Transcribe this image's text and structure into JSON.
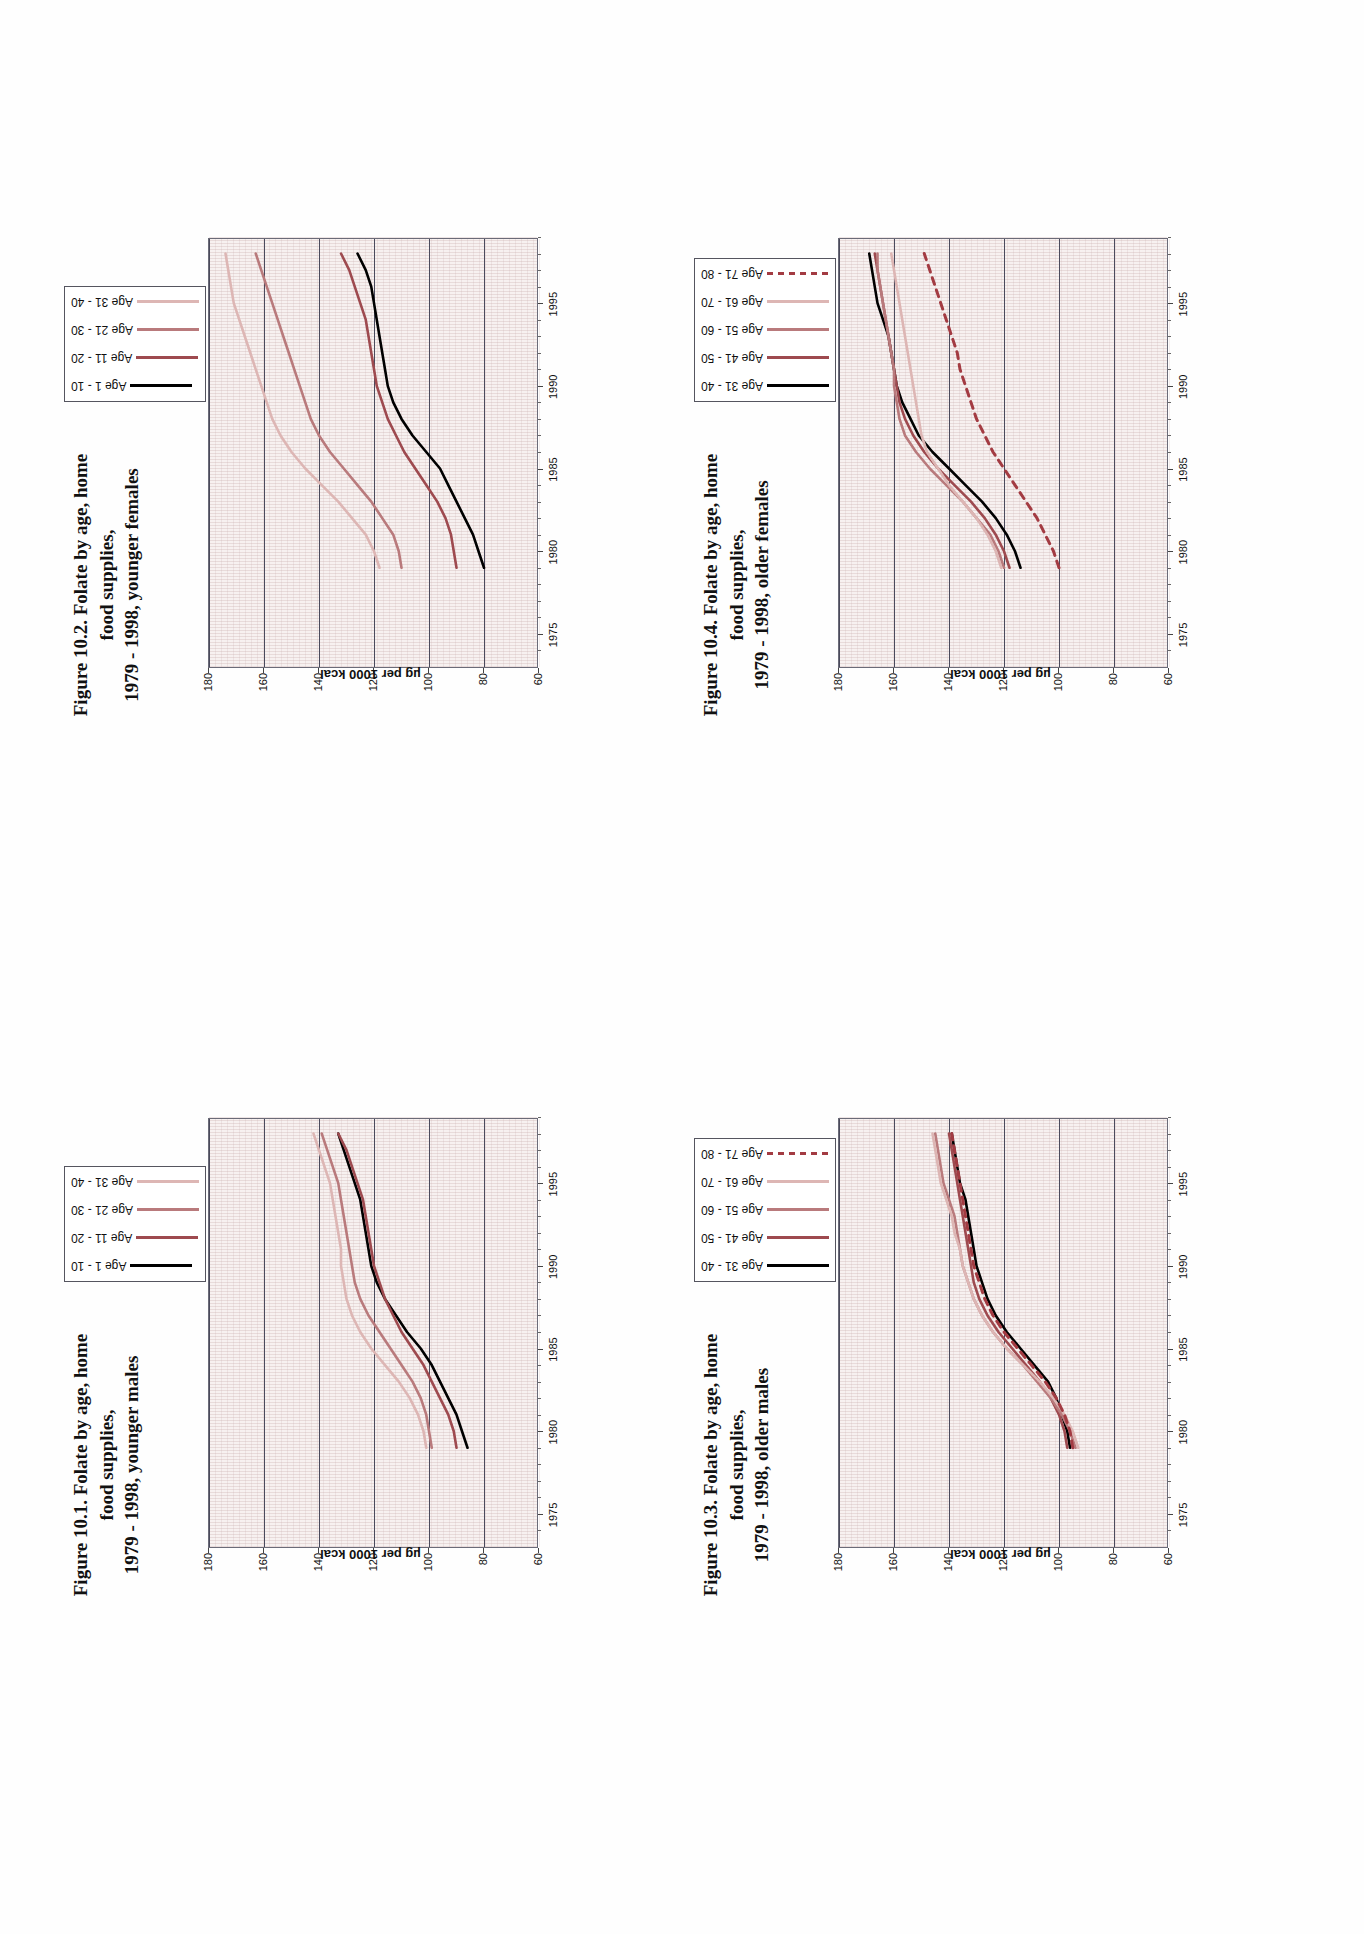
{
  "page": {
    "background": "#ffffff",
    "orientation": "landscape-rotated-90ccw"
  },
  "palette": {
    "series_1": "#000000",
    "series_2": "#9e4a4f",
    "series_3": "#b97a7c",
    "series_4": "#ddb6b4",
    "series_5": "#a33b42",
    "plot_bg": "#f7f1f0",
    "grid": "#4a4a5c",
    "axis": "#55555f"
  },
  "axis_common": {
    "ylabel": "µg per 1000 kcal",
    "yticks": [
      180,
      160,
      140,
      120,
      100,
      80,
      60
    ],
    "ylim": [
      60,
      180
    ],
    "xticks": [
      1975,
      1980,
      1985,
      1990,
      1995
    ],
    "xlim": [
      1973,
      1999
    ],
    "xlabel": ""
  },
  "figures": [
    {
      "id": "fig-10-1",
      "title": "Figure 10.1. Folate by age, home food supplies,\n1979 - 1998, younger males",
      "legend": [
        {
          "label": "Age 1 - 10",
          "color": "#000000",
          "dashed": false
        },
        {
          "label": "Age 11 - 20",
          "color": "#9e4a4f",
          "dashed": false
        },
        {
          "label": "Age 21 - 30",
          "color": "#b97a7c",
          "dashed": false
        },
        {
          "label": "Age 31 - 40",
          "color": "#ddb6b4",
          "dashed": false
        }
      ],
      "chart_data": {
        "type": "line",
        "title": "Figure 10.1. Folate by age, home food supplies, 1979 - 1998, younger males",
        "xlabel": "",
        "ylabel": "µg per 1000 kcal",
        "ylim": [
          60,
          180
        ],
        "xlim": [
          1973,
          1999
        ],
        "grid": true,
        "legend_position": "top-right",
        "x": [
          1979,
          1980,
          1981,
          1982,
          1983,
          1984,
          1985,
          1986,
          1987,
          1988,
          1989,
          1990,
          1991,
          1992,
          1993,
          1994,
          1995,
          1996,
          1997,
          1998
        ],
        "series": [
          {
            "name": "Age 1 - 10",
            "color": "#000000",
            "values": [
              86,
              88,
              90,
              93,
              96,
              99,
              103,
              108,
              112,
              116,
              119,
              121,
              122,
              123,
              124,
              125,
              127,
              129,
              131,
              133
            ]
          },
          {
            "name": "Age 11 - 20",
            "color": "#9e4a4f",
            "values": [
              90,
              91,
              93,
              96,
              99,
              102,
              106,
              110,
              113,
              116,
              118,
              120,
              121,
              122,
              123,
              124,
              126,
              128,
              130,
              133
            ]
          },
          {
            "name": "Age 21 - 30",
            "color": "#b97a7c",
            "values": [
              99,
              100,
              101,
              103,
              106,
              110,
              114,
              118,
              122,
              125,
              127,
              128,
              129,
              130,
              131,
              132,
              133,
              135,
              137,
              139
            ]
          },
          {
            "name": "Age 31 - 40",
            "color": "#ddb6b4",
            "values": [
              101,
              102,
              104,
              107,
              111,
              116,
              121,
              125,
              128,
              130,
              131,
              132,
              132,
              133,
              134,
              135,
              136,
              138,
              140,
              142
            ]
          }
        ]
      }
    },
    {
      "id": "fig-10-2",
      "title": "Figure 10.2. Folate by age, home food supplies,\n1979 - 1998, younger females",
      "legend": [
        {
          "label": "Age 1 - 10",
          "color": "#000000",
          "dashed": false
        },
        {
          "label": "Age 11 - 20",
          "color": "#9e4a4f",
          "dashed": false
        },
        {
          "label": "Age 21 - 30",
          "color": "#b97a7c",
          "dashed": false
        },
        {
          "label": "Age 31 - 40",
          "color": "#ddb6b4",
          "dashed": false
        }
      ],
      "chart_data": {
        "type": "line",
        "title": "Figure 10.2. Folate by age, home food supplies, 1979 - 1998, younger females",
        "xlabel": "",
        "ylabel": "µg per 1000 kcal",
        "ylim": [
          60,
          180
        ],
        "xlim": [
          1973,
          1999
        ],
        "grid": true,
        "legend_position": "top-right",
        "x": [
          1979,
          1980,
          1981,
          1982,
          1983,
          1984,
          1985,
          1986,
          1987,
          1988,
          1989,
          1990,
          1991,
          1992,
          1993,
          1994,
          1995,
          1996,
          1997,
          1998
        ],
        "series": [
          {
            "name": "Age 1 - 10",
            "color": "#000000",
            "values": [
              80,
              82,
              84,
              87,
              90,
              93,
              96,
              101,
              106,
              110,
              113,
              115,
              116,
              117,
              118,
              119,
              120,
              121,
              123,
              126
            ]
          },
          {
            "name": "Age 11 - 20",
            "color": "#9e4a4f",
            "values": [
              90,
              91,
              92,
              94,
              97,
              101,
              105,
              109,
              112,
              115,
              117,
              119,
              120,
              121,
              122,
              123,
              125,
              127,
              129,
              132
            ]
          },
          {
            "name": "Age 21 - 30",
            "color": "#b97a7c",
            "values": [
              110,
              111,
              113,
              117,
              121,
              126,
              131,
              136,
              140,
              143,
              145,
              147,
              149,
              151,
              153,
              155,
              157,
              159,
              161,
              163
            ]
          },
          {
            "name": "Age 31 - 40",
            "color": "#ddb6b4",
            "values": [
              118,
              120,
              123,
              128,
              133,
              139,
              145,
              150,
              154,
              157,
              159,
              161,
              163,
              165,
              167,
              169,
              171,
              172,
              173,
              174
            ]
          }
        ]
      }
    },
    {
      "id": "fig-10-3",
      "title": "Figure 10.3. Folate by age, home food supplies,\n1979 - 1998, older males",
      "legend": [
        {
          "label": "Age 31 - 40",
          "color": "#000000",
          "dashed": false
        },
        {
          "label": "Age 41 - 50",
          "color": "#9e4a4f",
          "dashed": false
        },
        {
          "label": "Age 51 - 60",
          "color": "#b97a7c",
          "dashed": false
        },
        {
          "label": "Age 61 - 70",
          "color": "#ddb6b4",
          "dashed": false
        },
        {
          "label": "Age 71 - 80",
          "color": "#a33b42",
          "dashed": true
        }
      ],
      "chart_data": {
        "type": "line",
        "title": "Figure 10.3. Folate by age, home food supplies, 1979 - 1998, older males",
        "xlabel": "",
        "ylabel": "µg per 1000 kcal",
        "ylim": [
          60,
          180
        ],
        "xlim": [
          1973,
          1999
        ],
        "grid": true,
        "legend_position": "top-right",
        "x": [
          1979,
          1980,
          1981,
          1982,
          1983,
          1984,
          1985,
          1986,
          1987,
          1988,
          1989,
          1990,
          1991,
          1992,
          1993,
          1994,
          1995,
          1996,
          1997,
          1998
        ],
        "series": [
          {
            "name": "Age 31 - 40",
            "color": "#000000",
            "values": [
              96,
              97,
              99,
              101,
              104,
              109,
              114,
              119,
              123,
              126,
              128,
              130,
              131,
              132,
              133,
              134,
              136,
              137,
              138,
              139
            ]
          },
          {
            "name": "Age 41 - 50",
            "color": "#9e4a4f",
            "values": [
              97,
              98,
              100,
              103,
              107,
              112,
              117,
              122,
              126,
              129,
              131,
              132,
              133,
              134,
              135,
              136,
              137,
              138,
              139,
              140
            ]
          },
          {
            "name": "Age 51 - 60",
            "color": "#b97a7c",
            "values": [
              94,
              96,
              99,
              103,
              108,
              113,
              119,
              124,
              128,
              131,
              133,
              135,
              136,
              137,
              138,
              140,
              142,
              143,
              144,
              145
            ]
          },
          {
            "name": "Age 61 - 70",
            "color": "#ddb6b4",
            "values": [
              93,
              95,
              98,
              102,
              107,
              113,
              119,
              124,
              128,
              131,
              133,
              135,
              136,
              138,
              139,
              141,
              143,
              144,
              145,
              146
            ]
          },
          {
            "name": "Age 71 - 80",
            "color": "#a33b42",
            "values": [
              95,
              96,
              98,
              101,
              105,
              110,
              115,
              120,
              124,
              127,
              129,
              131,
              132,
              133,
              134,
              135,
              136,
              137,
              138,
              139
            ]
          }
        ]
      }
    },
    {
      "id": "fig-10-4",
      "title": "Figure 10.4. Folate by age, home food supplies,\n1979 - 1998, older females",
      "legend": [
        {
          "label": "Age 31 - 40",
          "color": "#000000",
          "dashed": false
        },
        {
          "label": "Age 41 - 50",
          "color": "#9e4a4f",
          "dashed": false
        },
        {
          "label": "Age 51 - 60",
          "color": "#b97a7c",
          "dashed": false
        },
        {
          "label": "Age 61 - 70",
          "color": "#ddb6b4",
          "dashed": false
        },
        {
          "label": "Age 71 - 80",
          "color": "#a33b42",
          "dashed": true
        }
      ],
      "chart_data": {
        "type": "line",
        "title": "Figure 10.4. Folate by age, home food supplies, 1979 - 1998, older females",
        "xlabel": "",
        "ylabel": "µg per 1000 kcal",
        "ylim": [
          60,
          180
        ],
        "xlim": [
          1973,
          1999
        ],
        "grid": true,
        "legend_position": "top-right",
        "x": [
          1979,
          1980,
          1981,
          1982,
          1983,
          1984,
          1985,
          1986,
          1987,
          1988,
          1989,
          1990,
          1991,
          1992,
          1993,
          1994,
          1995,
          1996,
          1997,
          1998
        ],
        "series": [
          {
            "name": "Age 31 - 40",
            "color": "#000000",
            "values": [
              114,
              116,
              119,
              123,
              128,
              134,
              140,
              146,
              151,
              154,
              157,
              159,
              160,
              161,
              162,
              164,
              166,
              167,
              168,
              169
            ]
          },
          {
            "name": "Age 41 - 50",
            "color": "#9e4a4f",
            "values": [
              118,
              120,
              123,
              127,
              132,
              138,
              144,
              149,
              153,
              156,
              158,
              159,
              160,
              161,
              162,
              163,
              164,
              165,
              166,
              167
            ]
          },
          {
            "name": "Age 51 - 60",
            "color": "#b97a7c",
            "values": [
              120,
              122,
              125,
              130,
              135,
              141,
              147,
              152,
              156,
              158,
              159,
              160,
              160,
              161,
              162,
              163,
              164,
              165,
              166,
              166
            ]
          },
          {
            "name": "Age 61 - 70",
            "color": "#ddb6b4",
            "values": [
              121,
              123,
              126,
              130,
              135,
              140,
              144,
              148,
              150,
              151,
              152,
              153,
              154,
              155,
              156,
              157,
              158,
              159,
              160,
              161
            ]
          },
          {
            "name": "Age 71 - 80",
            "color": "#a33b42",
            "values": [
              100,
              102,
              105,
              108,
              112,
              116,
              120,
              124,
              127,
              130,
              132,
              134,
              136,
              137,
              139,
              141,
              143,
              145,
              147,
              149
            ]
          }
        ]
      }
    }
  ]
}
